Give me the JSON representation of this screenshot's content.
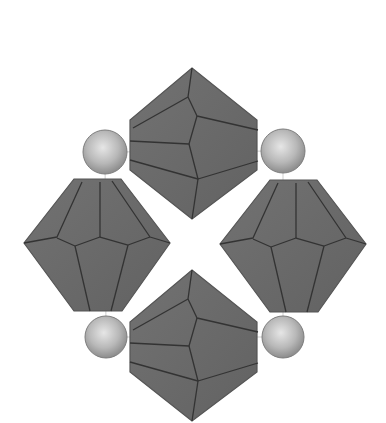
{
  "diagram": {
    "type": "beading-pattern",
    "colors": {
      "background": "#ffffff",
      "bead_fill": "#6b6b6b",
      "bead_facet_line": "#333333",
      "bead_outline": "#555555",
      "pearl_light": "#e6e6e6",
      "pearl_mid": "#b8b8b8",
      "pearl_dark": "#8c8c8c",
      "thread": "#c8c8c8"
    },
    "beads": [
      {
        "name": "top-bicone",
        "orientation": "vertical"
      },
      {
        "name": "left-bicone",
        "orientation": "horizontal"
      },
      {
        "name": "right-bicone",
        "orientation": "horizontal"
      },
      {
        "name": "bottom-bicone",
        "orientation": "vertical"
      }
    ],
    "pearls": [
      {
        "name": "pearl-top-left",
        "cx": 105,
        "cy": 152,
        "r": 22
      },
      {
        "name": "pearl-top-right",
        "cx": 283,
        "cy": 151,
        "r": 22
      },
      {
        "name": "pearl-bottom-left",
        "cx": 106,
        "cy": 337,
        "r": 21
      },
      {
        "name": "pearl-bottom-right",
        "cx": 283,
        "cy": 337,
        "r": 21
      }
    ]
  }
}
